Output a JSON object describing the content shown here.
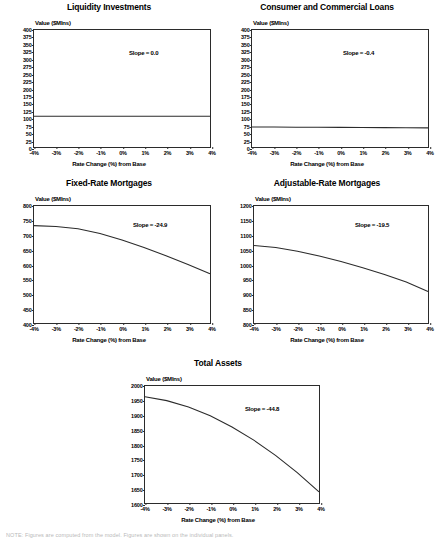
{
  "figure": {
    "background": "#ffffff",
    "line_color": "#2b2b2b",
    "axis_color": "#2b2b2b",
    "common_xlabel": "Rate Change (%) from Base",
    "common_ylabel": "Value ($Mlns)",
    "common_xticks": [
      "-4%",
      "-3%",
      "-2%",
      "-1%",
      "0%",
      "1%",
      "2%",
      "3%",
      "4%"
    ],
    "footnote": "NOTE: Figures are computed from the model. Figures are shown on the individual panels."
  },
  "chart_data": [
    {
      "id": "liquidity-investments",
      "type": "line",
      "title": "Liquidity Investments",
      "xlabel": "Rate Change (%) from Base",
      "ylabel": "Value ($Mlns)",
      "slope_label": "Slope = 0.0",
      "slope_value": 0.0,
      "xlim": [
        -4,
        4
      ],
      "ylim": [
        0,
        400
      ],
      "grid": false,
      "xticks": [
        "-4%",
        "-3%",
        "-2%",
        "-1%",
        "0%",
        "1%",
        "2%",
        "3%",
        "4%"
      ],
      "yticks": [
        0,
        25,
        50,
        75,
        100,
        125,
        150,
        175,
        200,
        225,
        250,
        275,
        300,
        325,
        350,
        375,
        400
      ],
      "x": [
        -4,
        -3,
        -2,
        -1,
        0,
        1,
        2,
        3,
        4
      ],
      "values": [
        105,
        105,
        105,
        105,
        105,
        105,
        105,
        105,
        105
      ]
    },
    {
      "id": "consumer-and-commercial-loans",
      "type": "line",
      "title": "Consumer and Commercial Loans",
      "xlabel": "Rate Change (%) from Base",
      "ylabel": "Value ($Mlns)",
      "slope_label": "Slope = -0.4",
      "slope_value": -0.4,
      "xlim": [
        -4,
        4
      ],
      "ylim": [
        0,
        400
      ],
      "grid": false,
      "xticks": [
        "-4%",
        "-3%",
        "-2%",
        "-1%",
        "0%",
        "1%",
        "2%",
        "3%",
        "4%"
      ],
      "yticks": [
        0,
        25,
        50,
        75,
        100,
        125,
        150,
        175,
        200,
        225,
        250,
        275,
        300,
        325,
        350,
        375,
        400
      ],
      "x": [
        -4,
        -3,
        -2,
        -1,
        0,
        1,
        2,
        3,
        4
      ],
      "values": [
        68.6,
        68.2,
        67.8,
        67.4,
        67.0,
        66.6,
        66.2,
        65.8,
        65.4
      ]
    },
    {
      "id": "fixed-rate-mortgages",
      "type": "line",
      "title": "Fixed-Rate Mortgages",
      "xlabel": "Rate Change (%) from Base",
      "ylabel": "Value ($Mlns)",
      "slope_label": "Slope = -24.9",
      "slope_value": -24.9,
      "xlim": [
        -4,
        4
      ],
      "ylim": [
        400,
        800
      ],
      "grid": false,
      "xticks": [
        "-4%",
        "-3%",
        "-2%",
        "-1%",
        "0%",
        "1%",
        "2%",
        "3%",
        "4%"
      ],
      "yticks": [
        400,
        450,
        500,
        550,
        600,
        650,
        700,
        750,
        800
      ],
      "x": [
        -4,
        -3,
        -2,
        -1,
        0,
        1,
        2,
        3,
        4
      ],
      "values": [
        733,
        730,
        722,
        706,
        684,
        658,
        630,
        600,
        568
      ]
    },
    {
      "id": "adjustable-rate-mortgages",
      "type": "line",
      "title": "Adjustable-Rate Mortgages",
      "xlabel": "Rate Change (%) from Base",
      "ylabel": "Value ($Mlns)",
      "slope_label": "Slope = -19.5",
      "slope_value": -19.5,
      "xlim": [
        -4,
        4
      ],
      "ylim": [
        800,
        1200
      ],
      "grid": false,
      "xticks": [
        "-4%",
        "-3%",
        "-2%",
        "-1%",
        "0%",
        "1%",
        "2%",
        "3%",
        "4%"
      ],
      "yticks": [
        800,
        850,
        900,
        950,
        1000,
        1050,
        1100,
        1150,
        1200
      ],
      "x": [
        -4,
        -3,
        -2,
        -1,
        0,
        1,
        2,
        3,
        4
      ],
      "values": [
        1065,
        1058,
        1045,
        1029,
        1010,
        989,
        966,
        940,
        908
      ]
    },
    {
      "id": "total-assets",
      "type": "line",
      "title": "Total Assets",
      "xlabel": "Rate Change (%) from Base",
      "ylabel": "Value ($Mlns)",
      "slope_label": "Slope = -44.8",
      "slope_value": -44.8,
      "xlim": [
        -4,
        4
      ],
      "ylim": [
        1600,
        2000
      ],
      "grid": false,
      "xticks": [
        "-4%",
        "-3%",
        "-2%",
        "-1%",
        "0%",
        "1%",
        "2%",
        "3%",
        "4%"
      ],
      "yticks": [
        1600,
        1650,
        1700,
        1750,
        1800,
        1850,
        1900,
        1950,
        2000
      ],
      "x": [
        -4,
        -3,
        -2,
        -1,
        0,
        1,
        2,
        3,
        4
      ],
      "values": [
        1963,
        1950,
        1928,
        1898,
        1860,
        1815,
        1763,
        1704,
        1638
      ]
    }
  ]
}
